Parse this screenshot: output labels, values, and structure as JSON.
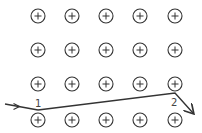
{
  "diagram": {
    "grid": {
      "rows": 4,
      "cols": 5,
      "symbol": "+",
      "col_x": [
        38,
        72,
        106,
        140,
        175
      ],
      "row_y": [
        16,
        50,
        84,
        120
      ],
      "radius": 7
    },
    "path": {
      "points": [
        [
          5,
          104
        ],
        [
          38,
          110
        ],
        [
          175,
          93
        ],
        [
          193,
          113
        ]
      ],
      "labels": [
        {
          "text": "1",
          "x": 36,
          "y": 107
        },
        {
          "text": "2",
          "x": 171,
          "y": 106
        }
      ]
    },
    "colors": {
      "stroke": "#333333",
      "background": "#ffffff"
    }
  }
}
